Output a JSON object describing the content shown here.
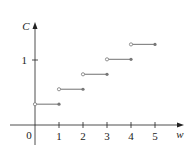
{
  "chart_data": {
    "type": "line",
    "subtype": "step",
    "title": "",
    "xlabel": "w",
    "ylabel": "C",
    "origin_label": "0",
    "x_ticks": [
      1,
      2,
      3,
      4,
      5
    ],
    "x_tick_labels": [
      "1",
      "2",
      "3",
      "4",
      "5"
    ],
    "y_ticks": [
      1
    ],
    "y_tick_labels": [
      "1"
    ],
    "xlim": [
      -1.1,
      5.9
    ],
    "ylim": [
      -0.45,
      1.5
    ],
    "grid": false,
    "legend": null,
    "steps": [
      {
        "x_start": 0,
        "x_end": 1,
        "y": 0.32,
        "open_left": true,
        "closed_right": true
      },
      {
        "x_start": 1,
        "x_end": 2,
        "y": 0.55,
        "open_left": true,
        "closed_right": true
      },
      {
        "x_start": 2,
        "x_end": 3,
        "y": 0.78,
        "open_left": true,
        "closed_right": true
      },
      {
        "x_start": 3,
        "x_end": 4,
        "y": 1.01,
        "open_left": true,
        "closed_right": true
      },
      {
        "x_start": 4,
        "x_end": 5,
        "y": 1.24,
        "open_left": true,
        "closed_right": true
      }
    ],
    "colors": {
      "axis": "#222222",
      "step_line": "#888888",
      "dot": "#777777"
    }
  }
}
